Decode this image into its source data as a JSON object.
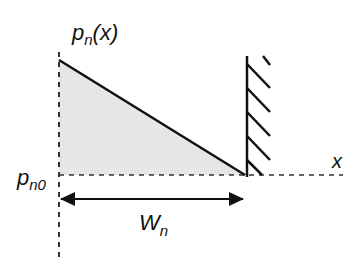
{
  "diagram": {
    "y_axis_label": {
      "main": "p",
      "sub": "n",
      "suffix": "(x)"
    },
    "x_axis_label": "x",
    "baseline_label": {
      "main": "p",
      "sub": "n0"
    },
    "width_label": {
      "main": "W",
      "sub": "n"
    },
    "colors": {
      "line": "#111111",
      "fill": "#e6e6e6",
      "dashed": "#333333"
    }
  }
}
